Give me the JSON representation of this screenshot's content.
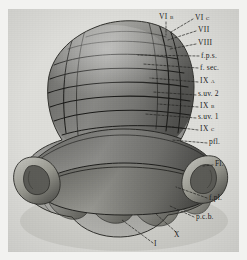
{
  "figure": {
    "kind": "anatomical-illustration",
    "view": "inferior-posterior",
    "background_color": "#f2f2f0",
    "plate_color": "#dededa",
    "ink_color": "#1b1b1b",
    "width": 247,
    "height": 260
  },
  "labels": [
    {
      "id": "vi-b",
      "text": "VI b",
      "x": 159,
      "y": 18,
      "anchor": "start"
    },
    {
      "id": "vi-c",
      "text": "VI c",
      "x": 195,
      "y": 19,
      "anchor": "start"
    },
    {
      "id": "vii",
      "text": "VII",
      "x": 198,
      "y": 31,
      "anchor": "start"
    },
    {
      "id": "viii",
      "text": "VIII",
      "x": 198,
      "y": 44,
      "anchor": "start"
    },
    {
      "id": "f-p-s",
      "text": "f.p.s.",
      "x": 201,
      "y": 57,
      "anchor": "start"
    },
    {
      "id": "f-sec",
      "text": "f. sec.",
      "x": 200,
      "y": 69,
      "anchor": "start"
    },
    {
      "id": "ix-a",
      "text": "IX a",
      "x": 200,
      "y": 82,
      "anchor": "start"
    },
    {
      "id": "s-uv-2",
      "text": "s.uv. 2",
      "x": 198,
      "y": 95,
      "anchor": "start"
    },
    {
      "id": "ix-b",
      "text": "IX b",
      "x": 200,
      "y": 107,
      "anchor": "start"
    },
    {
      "id": "s-uv-1",
      "text": "s.uv. 1",
      "x": 198,
      "y": 118,
      "anchor": "start"
    },
    {
      "id": "ix-c",
      "text": "IX c",
      "x": 200,
      "y": 130,
      "anchor": "start"
    },
    {
      "id": "p-fl",
      "text": "pfl.",
      "x": 209,
      "y": 143,
      "anchor": "start"
    },
    {
      "id": "fl",
      "text": "Fl.",
      "x": 215,
      "y": 165,
      "anchor": "start"
    },
    {
      "id": "f-pl",
      "text": "f.pl.",
      "x": 209,
      "y": 199,
      "anchor": "start"
    },
    {
      "id": "p-c-b",
      "text": "p.c.b.",
      "x": 196,
      "y": 218,
      "anchor": "start"
    },
    {
      "id": "x",
      "text": "X",
      "x": 174,
      "y": 236,
      "anchor": "start"
    },
    {
      "id": "i",
      "text": "I",
      "x": 154,
      "y": 245,
      "anchor": "start"
    }
  ],
  "leader_lines": [
    {
      "for": "vi-b",
      "x1": 166,
      "y1": 22,
      "x2": 166,
      "y2": 35
    },
    {
      "for": "vi-c",
      "x1": 193,
      "y1": 19,
      "x2": 171,
      "y2": 32
    },
    {
      "for": "vii",
      "x1": 196,
      "y1": 31,
      "x2": 168,
      "y2": 40
    },
    {
      "for": "viii",
      "x1": 196,
      "y1": 44,
      "x2": 170,
      "y2": 49
    },
    {
      "for": "f-p-s",
      "x1": 199,
      "y1": 56,
      "x2": 138,
      "y2": 55
    },
    {
      "for": "f-sec",
      "x1": 198,
      "y1": 68,
      "x2": 143,
      "y2": 64
    },
    {
      "for": "ix-a",
      "x1": 198,
      "y1": 82,
      "x2": 150,
      "y2": 78
    },
    {
      "for": "s-uv-2",
      "x1": 196,
      "y1": 95,
      "x2": 153,
      "y2": 92
    },
    {
      "for": "ix-b",
      "x1": 198,
      "y1": 107,
      "x2": 158,
      "y2": 104
    },
    {
      "for": "s-uv-1",
      "x1": 196,
      "y1": 118,
      "x2": 145,
      "y2": 114
    },
    {
      "for": "ix-c",
      "x1": 198,
      "y1": 130,
      "x2": 166,
      "y2": 126
    },
    {
      "for": "p-fl",
      "x1": 207,
      "y1": 143,
      "x2": 172,
      "y2": 140
    },
    {
      "for": "fl",
      "x1": 213,
      "y1": 165,
      "x2": 203,
      "y2": 166
    },
    {
      "for": "f-pl",
      "x1": 207,
      "y1": 198,
      "x2": 176,
      "y2": 187
    },
    {
      "for": "p-c-b",
      "x1": 194,
      "y1": 217,
      "x2": 170,
      "y2": 206
    },
    {
      "for": "x",
      "x1": 176,
      "y1": 232,
      "x2": 156,
      "y2": 214
    },
    {
      "for": "i",
      "x1": 153,
      "y1": 243,
      "x2": 122,
      "y2": 220
    }
  ],
  "structures": [
    {
      "id": "anterior-mass",
      "name": "upper folial mass"
    },
    {
      "id": "pyramis-band",
      "name": "mid transverse band"
    },
    {
      "id": "uvula-band",
      "name": "lower transverse band"
    },
    {
      "id": "flocculus-left",
      "name": "left flocculus"
    },
    {
      "id": "flocculus-right",
      "name": "right flocculus"
    },
    {
      "id": "nodulus-lobules",
      "name": "basal lobule row"
    }
  ]
}
